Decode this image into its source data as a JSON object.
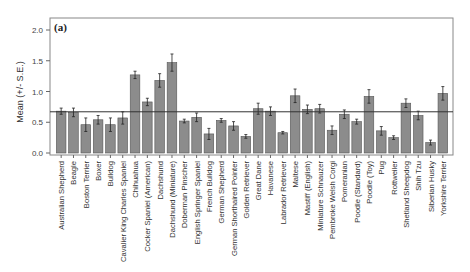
{
  "chart_data": {
    "type": "bar",
    "panel_label": "(a)",
    "title": "",
    "xlabel": "",
    "ylabel": "Mean (+/- S.E.)",
    "ylim": [
      0,
      2.0
    ],
    "yticks": [
      "0.0",
      "0.5",
      "1.0",
      "1.5",
      "2.0"
    ],
    "ytick_values": [
      0,
      0.5,
      1.0,
      1.5,
      2.0
    ],
    "grid": false,
    "legend": null,
    "reference_line": 0.67,
    "categories": [
      "Australian Shepherd",
      "Beagle",
      "Boston Terrier",
      "Boxer",
      "Bulldog",
      "Cavalier King Charles Spaniel",
      "Chihuahua",
      "Cocker Spaniel (American)",
      "Dachshund",
      "Dachshund (Miniature)",
      "Doberman Pinscher",
      "English Springer Spaniel",
      "French Bulldog",
      "German Shepherd",
      "German Shorthaired Pointer",
      "Golden Retriever",
      "Great Dane",
      "Havanese",
      "Labrador Retriever",
      "Maltese",
      "Mastiff (English)",
      "Miniature Schnauzer",
      "Pembroke Welsh Corgi",
      "Pomeranian",
      "Poodle (Standard)",
      "Poodle (Toy)",
      "Pug",
      "Rottweiler",
      "Shetland Sheepdog",
      "Shih Tzu",
      "Siberian Husky",
      "Yorkshire Terrier"
    ],
    "values": [
      0.68,
      0.66,
      0.46,
      0.54,
      0.46,
      0.57,
      1.27,
      0.83,
      1.18,
      1.47,
      0.52,
      0.58,
      0.31,
      0.53,
      0.44,
      0.27,
      0.72,
      0.68,
      0.33,
      0.93,
      0.71,
      0.72,
      0.37,
      0.63,
      0.51,
      0.92,
      0.36,
      0.25,
      0.81,
      0.61,
      0.17,
      0.97
    ],
    "errors": [
      0.05,
      0.07,
      0.11,
      0.07,
      0.11,
      0.1,
      0.06,
      0.06,
      0.11,
      0.14,
      0.03,
      0.07,
      0.09,
      0.03,
      0.07,
      0.03,
      0.09,
      0.07,
      0.02,
      0.11,
      0.07,
      0.07,
      0.07,
      0.07,
      0.04,
      0.11,
      0.07,
      0.03,
      0.07,
      0.07,
      0.04,
      0.11
    ],
    "colors": {
      "bar_fill": "#8c8c8c",
      "bar_stroke": "#555555",
      "axis": "#444444",
      "reference_line": "#333333"
    }
  }
}
